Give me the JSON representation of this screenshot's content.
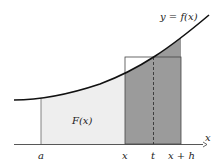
{
  "diagram": {
    "curve_label": "y = f(x)",
    "area_label": "F(x)",
    "axis_label": "x",
    "ticks": [
      {
        "id": "a",
        "label": "a"
      },
      {
        "id": "x",
        "label": "x"
      },
      {
        "id": "t",
        "label": "t"
      },
      {
        "id": "xh",
        "label": "x + h"
      }
    ],
    "colors": {
      "light_fill": "#eeeeee",
      "dark_fill": "#999999",
      "curve": "#111111",
      "lines": "#555555"
    }
  }
}
